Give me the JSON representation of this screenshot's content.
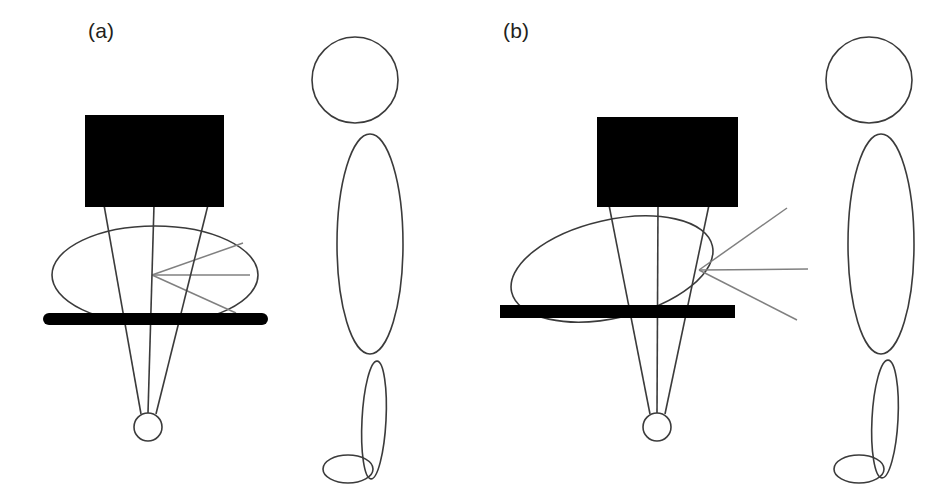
{
  "figure": {
    "type": "diagram",
    "background_color": "#ffffff",
    "width": 949,
    "height": 498,
    "colors": {
      "ink": "#231f20",
      "stroke": "#3b3b3b",
      "gray_ray": "#808080",
      "fill_black": "#000000",
      "background": "#ffffff"
    },
    "panels": [
      {
        "id": "a",
        "label": "(a)",
        "label_x": 88,
        "label_y": 19,
        "monitor": {
          "name": "display-rectangle",
          "x": 85,
          "y": 115,
          "width": 139,
          "height": 92,
          "fill": "#000000"
        },
        "head_ellipse": {
          "name": "head-ellipse",
          "cx": 155,
          "cy": 275,
          "rx": 103,
          "ry": 49,
          "rotation": 0
        },
        "desk_bar": {
          "name": "desk-bar",
          "x": 43,
          "y": 313,
          "width": 225,
          "height": 12,
          "fill": "#000000"
        },
        "wheel": {
          "name": "base-circle",
          "cx": 148,
          "cy": 427,
          "r": 14
        },
        "beam_lines": [
          {
            "x1": 104,
            "y1": 207,
            "x2": 141,
            "y2": 414
          },
          {
            "x1": 154,
            "y1": 207,
            "x2": 148,
            "y2": 413
          },
          {
            "x1": 208,
            "y1": 207,
            "x2": 156,
            "y2": 414
          }
        ],
        "sight_rays": {
          "origin_x": 152,
          "origin_y": 275,
          "endpoints": [
            {
              "x": 243,
              "y": 243
            },
            {
              "x": 250,
              "y": 275
            },
            {
              "x": 236,
              "y": 313
            }
          ]
        },
        "figure_person": {
          "head": {
            "cx": 355,
            "cy": 80,
            "r": 43
          },
          "torso": {
            "cx": 370,
            "cy": 244,
            "rx": 33,
            "ry": 110
          },
          "leg": {
            "cx": 374,
            "cy": 420,
            "rx": 12,
            "ry": 59,
            "rotation": 3
          },
          "foot": {
            "cx": 348,
            "cy": 469,
            "rx": 25,
            "ry": 14
          }
        }
      },
      {
        "id": "b",
        "label": "(b)",
        "label_x": 503,
        "label_y": 19,
        "monitor": {
          "name": "display-rectangle",
          "x": 597,
          "y": 117,
          "width": 141,
          "height": 90,
          "fill": "#000000"
        },
        "head_ellipse": {
          "name": "head-ellipse",
          "cx": 612,
          "cy": 269,
          "rx": 103,
          "ry": 49,
          "rotation": -13
        },
        "desk_bar": {
          "name": "desk-bar",
          "x": 500,
          "y": 305,
          "width": 235,
          "height": 13,
          "fill": "#000000"
        },
        "wheel": {
          "name": "base-circle",
          "cx": 657,
          "cy": 427,
          "r": 14
        },
        "beam_lines": [
          {
            "x1": 609,
            "y1": 207,
            "x2": 650,
            "y2": 414
          },
          {
            "x1": 658,
            "y1": 207,
            "x2": 657,
            "y2": 413
          },
          {
            "x1": 709,
            "y1": 207,
            "x2": 665,
            "y2": 414
          }
        ],
        "sight_rays": {
          "origin_x": 699,
          "origin_y": 270,
          "endpoints": [
            {
              "x": 787,
              "y": 208
            },
            {
              "x": 808,
              "y": 269
            },
            {
              "x": 797,
              "y": 320
            }
          ]
        },
        "figure_person": {
          "head": {
            "cx": 869,
            "cy": 80,
            "r": 43
          },
          "torso": {
            "cx": 881,
            "cy": 244,
            "rx": 33,
            "ry": 110
          },
          "leg": {
            "cx": 885,
            "cy": 419,
            "rx": 13,
            "ry": 59,
            "rotation": 3
          },
          "foot": {
            "cx": 859,
            "cy": 469,
            "rx": 25,
            "ry": 14
          }
        }
      }
    ]
  }
}
